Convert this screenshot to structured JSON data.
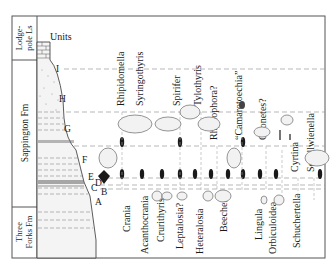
{
  "formations": [
    {
      "name": "Lodgepole Ls",
      "line1": "Lodge-",
      "line2": "pole Ls"
    },
    {
      "name": "Sappington Fm",
      "line1": "Sappington  Fm",
      "line2": ""
    },
    {
      "name": "Three Forks Fm",
      "line1": "Three",
      "line2": "Forks Fm"
    }
  ],
  "units_label": "Units",
  "units": [
    "I",
    "H",
    "G",
    "F",
    "E",
    "D",
    "C",
    "B",
    "A"
  ],
  "top_taxa": [
    "Rhipidomella",
    "Syringothyris",
    "Spirifer",
    "Tylothyris",
    "Rhytiophora?",
    "“Camarotoechia”",
    "Chonetes?",
    "Cyrtina",
    "Schellwienella"
  ],
  "bottom_taxa": [
    "Crania",
    "Acanthocrania",
    "Crurithyris",
    "Leptalosia?",
    "Heteralosia",
    "Beecheria",
    "Lingula",
    "Orbiculoidea",
    "Schuchertella"
  ],
  "colors": {
    "ink": "#1a1a1a",
    "frame": "#555555",
    "dash": "#9a9a9a",
    "shell": "#7a7a7a"
  }
}
